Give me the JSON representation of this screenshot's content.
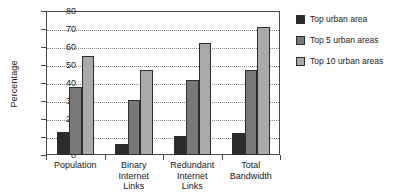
{
  "chart_data": {
    "type": "bar",
    "title": "",
    "xlabel": "",
    "ylabel": "Percentage",
    "ylim": [
      0,
      80
    ],
    "ytick_step": 10,
    "yticks": [
      0,
      10,
      20,
      30,
      40,
      50,
      60,
      70,
      80
    ],
    "ytick_labels": [
      "0",
      "10",
      "20",
      "30",
      "40",
      "50",
      "60",
      "70",
      "80"
    ],
    "grid": true,
    "grid_axis": "y",
    "legend_position": "right",
    "categories": [
      "Population",
      "Binary\nInternet\nLinks",
      "Redundant\nInternet\nLinks",
      "Total\nBandwidth"
    ],
    "category_labels": [
      "Population",
      "Binary Internet Links",
      "Redundant Internet Links",
      "Total Bandwidth"
    ],
    "series": [
      {
        "name": "Top urban area",
        "color": "#2b2b2b",
        "values": [
          13,
          6,
          10.5,
          12
        ]
      },
      {
        "name": "Top 5 urban areas",
        "color": "#787878",
        "values": [
          38,
          30.5,
          41.5,
          47.5
        ]
      },
      {
        "name": "Top 10 urban areas",
        "color": "#aaaaaa",
        "values": [
          55,
          47.5,
          62,
          71
        ]
      }
    ]
  },
  "legend": {
    "items": [
      {
        "label": "Top urban area",
        "color": "#2b2b2b"
      },
      {
        "label": "Top 5 urban areas",
        "color": "#787878"
      },
      {
        "label": "Top 10 urban areas",
        "color": "#aaaaaa"
      }
    ]
  },
  "axes": {
    "y_title": "Percentage"
  },
  "colors": {
    "frame": "#4a4a4a",
    "grid": "#8a8a8a",
    "bar_outline": "#2e2e2e",
    "background": "#ffffff",
    "text": "#1a1a1a"
  }
}
